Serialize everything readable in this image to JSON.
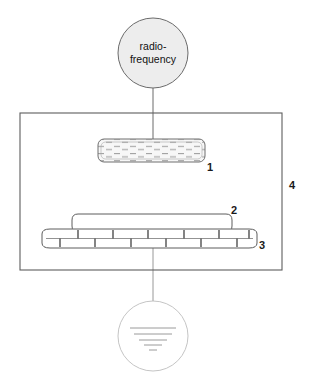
{
  "figure": {
    "type": "schematic-diagram",
    "background_color": "#ffffff",
    "line_color": "#555555",
    "text_color": "#111111"
  },
  "source_node": {
    "name": "radio-frequency-source",
    "shape": "circle",
    "line1": "radio-",
    "line2": "frequency",
    "fill_color": "#eeeeee",
    "center_x": 153,
    "center_y": 53,
    "radius": 35
  },
  "ground_node": {
    "name": "ground-symbol",
    "shape": "circle",
    "center_x": 153,
    "center_y": 336,
    "radius": 35,
    "bar_count": 5
  },
  "chamber": {
    "label": "4",
    "name": "chamber-enclosure",
    "x": 20,
    "y": 113,
    "width": 262,
    "height": 157
  },
  "components": [
    {
      "id": "1",
      "name": "hatched-electrode",
      "label": "1",
      "x": 98,
      "y": 139,
      "width": 107,
      "height": 23,
      "fill": "#f7f7f7",
      "texture": "dashes"
    },
    {
      "id": "2",
      "name": "upper-plate",
      "label": "2",
      "x": 72,
      "y": 214,
      "width": 160,
      "height": 18,
      "fill": "#ffffff"
    },
    {
      "id": "3",
      "name": "interdigitated-comb",
      "label": "3",
      "x": 42,
      "y": 229,
      "width": 215,
      "height": 19,
      "fill": "#ffffff",
      "finger_count": 22
    }
  ],
  "labels": [
    {
      "text": "1",
      "name": "callout-label-1",
      "x": 207,
      "y": 162
    },
    {
      "text": "2",
      "name": "callout-label-2",
      "x": 231,
      "y": 205
    },
    {
      "text": "3",
      "name": "callout-label-3",
      "x": 259,
      "y": 240
    },
    {
      "text": "4",
      "name": "callout-label-4",
      "x": 289,
      "y": 180
    }
  ],
  "connectors": [
    {
      "name": "rf-to-electrode-lead",
      "x1": 153,
      "y1": 88,
      "x2": 153,
      "y2": 140
    },
    {
      "name": "comb-to-ground-lead",
      "x1": 153,
      "y1": 248,
      "x2": 153,
      "y2": 336
    }
  ]
}
